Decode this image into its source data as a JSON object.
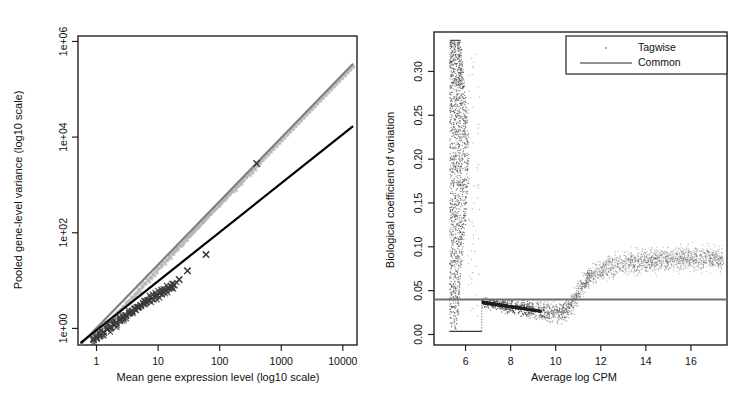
{
  "figure": {
    "background": "#ffffff",
    "panel_count": 2
  },
  "chart_data": [
    {
      "type": "scatter",
      "id": "pooled-variance-vs-mean",
      "title": "",
      "xlabel": "Mean gene expression level (log10 scale)",
      "ylabel": "Pooled gene-level variance (log10 scale)",
      "xscale": "log10",
      "yscale": "log10",
      "xlim": [
        0.5,
        17000
      ],
      "ylim": [
        0.45,
        1300000
      ],
      "xticks": [
        1,
        10,
        100,
        1000,
        10000
      ],
      "xtick_labels": [
        "1",
        "10",
        "100",
        "1000",
        "10000"
      ],
      "yticks": [
        1,
        100,
        10000,
        1000000
      ],
      "ytick_labels": [
        "1e+00",
        "1e+02",
        "1e+04",
        "1e+06"
      ],
      "grid": false,
      "box": true,
      "series": [
        {
          "name": "points-gray",
          "marker": "circle",
          "color": "#b4b4b4",
          "x": [
            0.85,
            0.9,
            0.95,
            1.0,
            1.05,
            1.1,
            1.2,
            1.3,
            1.4,
            1.5,
            1.6,
            1.8,
            2.0,
            2.2,
            2.5,
            2.8,
            3.1,
            3.4,
            3.8,
            4.2,
            4.6,
            5.0,
            5.6,
            6.2,
            6.9,
            7.6,
            8.4,
            9.3,
            10.3,
            11.4,
            12.6,
            14.0,
            15.5,
            17.2,
            19.0,
            21.0,
            23.3,
            25.8,
            28.6,
            31.6,
            35.0,
            38.8,
            43.0,
            47.6,
            52.7,
            58.4,
            64.7,
            71.6,
            79.3,
            87.9,
            97.3,
            108,
            119,
            132,
            147,
            162,
            180,
            199,
            221,
            244,
            271,
            300,
            332,
            368,
            408,
            452,
            500,
            554,
            614,
            680,
            754,
            835,
            925,
            1025,
            1135,
            1258,
            1393,
            1543,
            1710,
            1894,
            2098,
            2324,
            2575,
            2852,
            3160,
            3500,
            3878,
            4295,
            4760,
            5270,
            5840,
            6470,
            7170,
            7940,
            8800,
            9750,
            10800,
            12000,
            13300,
            14700
          ],
          "y": [
            0.62,
            0.66,
            0.7,
            0.75,
            0.8,
            0.86,
            0.95,
            1.05,
            1.15,
            1.27,
            1.4,
            1.6,
            1.85,
            2.1,
            2.45,
            2.85,
            3.25,
            3.7,
            4.3,
            4.9,
            5.6,
            6.4,
            7.4,
            8.6,
            10.0,
            11.5,
            13.3,
            15.4,
            17.8,
            20.5,
            23.5,
            27.2,
            31.3,
            36.0,
            41.0,
            47.0,
            54.0,
            62.0,
            71.0,
            81.0,
            93.0,
            107,
            123,
            141,
            162,
            186,
            213,
            244,
            280,
            321,
            368,
            422,
            484,
            555,
            636,
            729,
            836,
            958,
            1098,
            1260,
            1443,
            1654,
            1896,
            2173,
            2490,
            2854,
            3270,
            3748,
            4295,
            4922,
            5640,
            6464,
            7408,
            8489,
            9729,
            11150,
            12780,
            14650,
            16790,
            19240,
            22050,
            25270,
            28960,
            33190,
            38030,
            43590,
            49950,
            57240,
            65600,
            75180,
            86150,
            98720,
            113100,
            129600,
            148500,
            170200,
            195000,
            223500,
            256100,
            293500,
            336300
          ]
        },
        {
          "name": "points-dark-x",
          "marker": "x",
          "color": "#3a3a3a",
          "x": [
            0.9,
            1.0,
            1.15,
            1.3,
            1.5,
            1.7,
            1.9,
            2.1,
            2.4,
            2.7,
            3.0,
            3.4,
            3.8,
            4.2,
            4.7,
            5.2,
            5.8,
            6.4,
            7.1,
            7.9,
            8.8,
            9.7,
            10.8,
            12.0,
            13.3,
            14.8,
            16.4,
            18.2,
            22.0,
            30.0,
            60.0,
            400.0
          ],
          "y": [
            0.58,
            0.64,
            0.72,
            0.82,
            0.95,
            1.08,
            1.2,
            1.33,
            1.5,
            1.68,
            1.85,
            2.08,
            2.3,
            2.5,
            2.75,
            3.0,
            3.3,
            3.6,
            3.9,
            4.25,
            4.6,
            5.0,
            5.4,
            5.9,
            6.4,
            6.9,
            7.5,
            8.1,
            10.5,
            16.0,
            35.0,
            2800.0
          ]
        }
      ],
      "lines": [
        {
          "name": "gray-fit-line",
          "color": "#808080",
          "width": 2.2,
          "points": [
            [
              0.55,
              0.46
            ],
            [
              14700,
              340000
            ]
          ]
        },
        {
          "name": "black-fit-line",
          "color": "#000000",
          "width": 2.2,
          "points": [
            [
              0.55,
              0.5
            ],
            [
              14700,
              17000
            ]
          ]
        }
      ]
    },
    {
      "type": "scatter",
      "id": "bcv-vs-avg-log-cpm",
      "title": "",
      "xlabel": "Average log CPM",
      "ylabel": "Biological coefficient of variation",
      "xscale": "linear",
      "yscale": "linear",
      "xlim": [
        4.6,
        17.6
      ],
      "ylim": [
        -0.012,
        0.345
      ],
      "xticks": [
        6,
        8,
        10,
        12,
        14,
        16
      ],
      "xtick_labels": [
        "6",
        "8",
        "10",
        "12",
        "14",
        "16"
      ],
      "yticks": [
        0.0,
        0.05,
        0.1,
        0.15,
        0.2,
        0.25,
        0.3
      ],
      "ytick_labels": [
        "0.00",
        "0.05",
        "0.10",
        "0.15",
        "0.20",
        "0.25",
        "0.30"
      ],
      "grid": false,
      "box": true,
      "common_dispersion_bcv": 0.04,
      "legend": {
        "position": "top-right",
        "entries": [
          {
            "label": "Tagwise",
            "marker": "dot",
            "color": "#8a8a8a"
          },
          {
            "label": "Common",
            "marker": "line",
            "color": "#6e6e6e"
          }
        ]
      },
      "series": [
        {
          "name": "Tagwise",
          "marker": "dot",
          "color": "#555555",
          "description": "dense vertical column of tagwise dispersion points near logCPM 5.3-6.1 spanning BCV 0.00 to 0.335, plus a trend band from logCPM 6.7 rightwards"
        },
        {
          "name": "Common",
          "marker": "line",
          "color": "#6e6e6e",
          "value": 0.04
        }
      ],
      "trend_curve": {
        "name": "tagwise-trend",
        "x": [
          6.7,
          7.0,
          7.4,
          7.8,
          8.2,
          8.6,
          9.0,
          9.4,
          9.8,
          10.2,
          10.5,
          10.8,
          11.1,
          11.4,
          11.8,
          12.2,
          12.6,
          13.0,
          13.5,
          14.0,
          14.6,
          15.2,
          15.8,
          16.4,
          17.0,
          17.4
        ],
        "y": [
          0.037,
          0.0355,
          0.034,
          0.0325,
          0.031,
          0.0295,
          0.028,
          0.026,
          0.025,
          0.025,
          0.028,
          0.038,
          0.052,
          0.063,
          0.071,
          0.076,
          0.079,
          0.081,
          0.083,
          0.084,
          0.085,
          0.086,
          0.086,
          0.087,
          0.087,
          0.087
        ]
      }
    }
  ]
}
